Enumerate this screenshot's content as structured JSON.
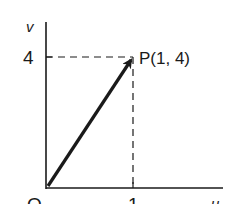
{
  "diagram": {
    "axes": {
      "x_label": "u",
      "y_label": "v",
      "origin_label": "O",
      "x_tick_label": "1",
      "y_tick_label": "4"
    },
    "point": {
      "label": "P(1, 4)",
      "x": 1,
      "y": 4
    },
    "vector": {
      "from": [
        0,
        0
      ],
      "to": [
        1,
        4
      ],
      "description": "position vector OP"
    },
    "colors": {
      "ink": "#1a1a1a",
      "background": "#ffffff"
    }
  }
}
